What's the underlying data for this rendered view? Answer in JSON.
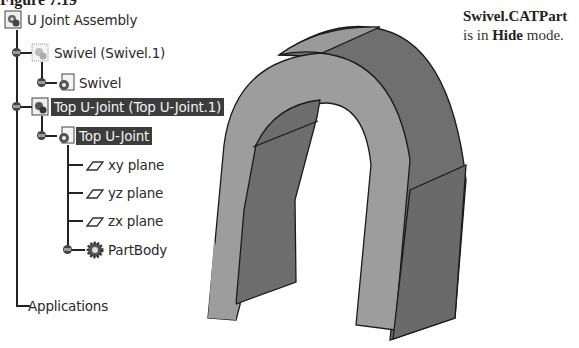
{
  "figure_title": "Figure 7.19",
  "note": {
    "bold1": "Swivel.CATPart",
    "text1": " is in ",
    "bold2": "Hide",
    "text2": " mode."
  },
  "tree": {
    "root": "U Joint Assembly",
    "items": [
      {
        "label": "Swivel (Swivel.1)",
        "icon": "product-icon-hidden",
        "selected": false
      },
      {
        "label": "Swivel",
        "icon": "part-icon",
        "selected": false
      },
      {
        "label": "Top U-Joint (Top U-Joint.1)",
        "icon": "product-icon",
        "selected": true
      },
      {
        "label": "Top U-Joint",
        "icon": "part-icon",
        "selected": true
      },
      {
        "label": "xy plane",
        "icon": "plane-icon",
        "selected": false
      },
      {
        "label": "yz plane",
        "icon": "plane-icon",
        "selected": false
      },
      {
        "label": "zx plane",
        "icon": "plane-icon",
        "selected": false
      },
      {
        "label": "PartBody",
        "icon": "body-icon",
        "selected": false
      }
    ],
    "applications": "Applications"
  },
  "model": {
    "name": "Top U-Joint 3D model",
    "light_face": "#9a9a9a",
    "dark_face": "#6f6f6f"
  }
}
